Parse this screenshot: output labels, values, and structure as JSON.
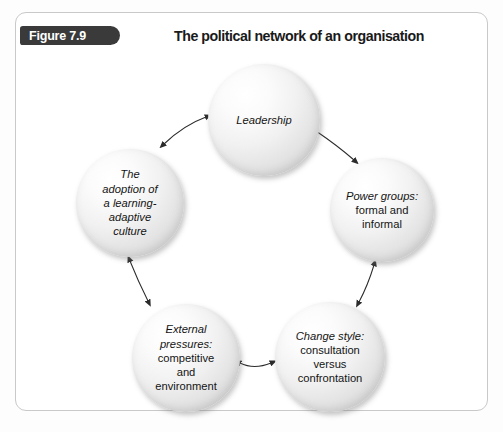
{
  "figure": {
    "badge_label": "Figure 7.9",
    "title": "The political network of an organisation"
  },
  "diagram": {
    "type": "cycle-network",
    "nodes": [
      {
        "id": "leadership",
        "name": "Leadership",
        "lines": [
          {
            "text": "Leadership",
            "style": "italic"
          }
        ]
      },
      {
        "id": "power-groups",
        "name": "Power groups: formal and informal",
        "lines": [
          {
            "text": "Power groups:",
            "style": "italic"
          },
          {
            "text": "formal and",
            "style": "regular"
          },
          {
            "text": "informal",
            "style": "regular"
          }
        ]
      },
      {
        "id": "change-style",
        "name": "Change style: consultation versus confrontation",
        "lines": [
          {
            "text": "Change style:",
            "style": "italic"
          },
          {
            "text": "consultation",
            "style": "regular"
          },
          {
            "text": "versus",
            "style": "regular"
          },
          {
            "text": "confrontation",
            "style": "regular"
          }
        ]
      },
      {
        "id": "external-pressures",
        "name": "External pressures: competitive and environment",
        "lines": [
          {
            "text": "External",
            "style": "italic"
          },
          {
            "text": "pressures:",
            "style": "italic"
          },
          {
            "text": "competitive",
            "style": "regular"
          },
          {
            "text": "and",
            "style": "regular"
          },
          {
            "text": "environment",
            "style": "regular"
          }
        ]
      },
      {
        "id": "adoption-culture",
        "name": "The adoption of a learning-adaptive culture",
        "lines": [
          {
            "text": "The",
            "style": "italic"
          },
          {
            "text": "adoption of",
            "style": "italic"
          },
          {
            "text": "a learning-",
            "style": "italic"
          },
          {
            "text": "adaptive",
            "style": "italic"
          },
          {
            "text": "culture",
            "style": "italic"
          }
        ]
      }
    ],
    "connectors": [
      {
        "from": "adoption-culture",
        "to": "leadership",
        "arrowheads": "both"
      },
      {
        "from": "leadership",
        "to": "power-groups",
        "arrowheads": "both"
      },
      {
        "from": "power-groups",
        "to": "change-style",
        "arrowheads": "both"
      },
      {
        "from": "change-style",
        "to": "external-pressures",
        "arrowheads": "both"
      },
      {
        "from": "external-pressures",
        "to": "adoption-culture",
        "arrowheads": "both"
      }
    ]
  },
  "colors": {
    "badge_background": "#3a3a3a",
    "badge_text": "#ffffff",
    "title_text": "#1a1a1a",
    "panel_border": "#c9c9c9",
    "panel_background": "#ffffff",
    "page_background": "#fdfdfd",
    "node_text": "#141414",
    "connector": "#2b2b2b"
  }
}
